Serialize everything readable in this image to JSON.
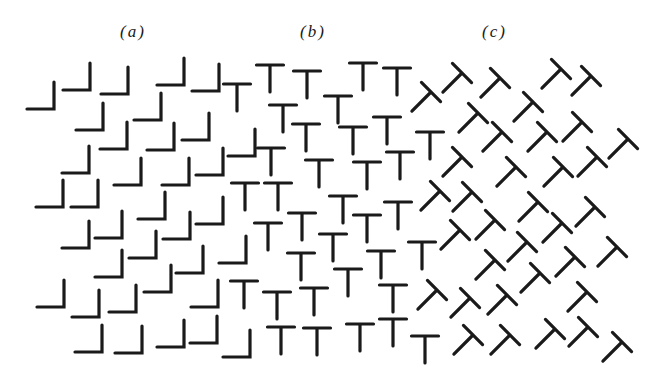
{
  "figure": {
    "labels": [
      {
        "id": "a",
        "text": "(a)",
        "x": 120
      },
      {
        "id": "b",
        "text": "(b)",
        "x": 300
      },
      {
        "id": "c",
        "text": "(c)",
        "x": 482
      }
    ],
    "ink_color": "#1a1a1a",
    "background_color": "#ffffff",
    "glyph_size": 27,
    "regions": {
      "a": {
        "shape": "L",
        "description": "mirrored L shapes (corner at bottom-right)",
        "corners": [
          [
            54,
            109
          ],
          [
            90,
            90
          ],
          [
            128,
            94
          ],
          [
            184,
            85
          ],
          [
            219,
            91
          ],
          [
            103,
            130
          ],
          [
            161,
            120
          ],
          [
            127,
            149
          ],
          [
            174,
            150
          ],
          [
            209,
            140
          ],
          [
            255,
            156
          ],
          [
            89,
            173
          ],
          [
            141,
            185
          ],
          [
            189,
            185
          ],
          [
            223,
            175
          ],
          [
            63,
            207
          ],
          [
            98,
            207
          ],
          [
            165,
            219
          ],
          [
            223,
            224
          ],
          [
            89,
            248
          ],
          [
            122,
            238
          ],
          [
            190,
            239
          ],
          [
            156,
            258
          ],
          [
            246,
            263
          ],
          [
            122,
            277
          ],
          [
            203,
            273
          ],
          [
            64,
            307
          ],
          [
            99,
            317
          ],
          [
            136,
            312
          ],
          [
            171,
            292
          ],
          [
            218,
            307
          ],
          [
            102,
            352
          ],
          [
            142,
            353
          ],
          [
            184,
            347
          ],
          [
            217,
            343
          ],
          [
            250,
            357
          ]
        ]
      },
      "b": {
        "shape": "T",
        "description": "upright T shapes (crossbar top-center)",
        "tops": [
          [
            237,
            84
          ],
          [
            270,
            65
          ],
          [
            307,
            71
          ],
          [
            363,
            63
          ],
          [
            397,
            68
          ],
          [
            283,
            105
          ],
          [
            338,
            96
          ],
          [
            306,
            124
          ],
          [
            353,
            127
          ],
          [
            387,
            117
          ],
          [
            430,
            132
          ],
          [
            271,
            148
          ],
          [
            319,
            160
          ],
          [
            367,
            162
          ],
          [
            400,
            152
          ],
          [
            245,
            183
          ],
          [
            278,
            183
          ],
          [
            343,
            196
          ],
          [
            398,
            202
          ],
          [
            302,
            213
          ],
          [
            367,
            215
          ],
          [
            268,
            223
          ],
          [
            333,
            234
          ],
          [
            422,
            242
          ],
          [
            301,
            253
          ],
          [
            381,
            251
          ],
          [
            348,
            269
          ],
          [
            244,
            281
          ],
          [
            277,
            292
          ],
          [
            314,
            288
          ],
          [
            393,
            285
          ],
          [
            281,
            327
          ],
          [
            317,
            328
          ],
          [
            360,
            324
          ],
          [
            393,
            319
          ],
          [
            425,
            336
          ]
        ]
      },
      "c": {
        "shape": "T-rotated-45",
        "description": "T shapes rotated 45 degrees clockwise (junction point)",
        "rotation_deg": 45,
        "junctions": [
          [
            431,
            92
          ],
          [
            462,
            73
          ],
          [
            500,
            78
          ],
          [
            561,
            69
          ],
          [
            591,
            76
          ],
          [
            478,
            113
          ],
          [
            533,
            102
          ],
          [
            502,
            132
          ],
          [
            547,
            132
          ],
          [
            582,
            122
          ],
          [
            628,
            139
          ],
          [
            462,
            157
          ],
          [
            516,
            167
          ],
          [
            563,
            167
          ],
          [
            597,
            157
          ],
          [
            440,
            191
          ],
          [
            472,
            192
          ],
          [
            538,
            202
          ],
          [
            595,
            207
          ],
          [
            460,
            230
          ],
          [
            495,
            220
          ],
          [
            562,
            223
          ],
          [
            527,
            242
          ],
          [
            617,
            247
          ],
          [
            495,
            260
          ],
          [
            575,
            257
          ],
          [
            540,
            273
          ],
          [
            437,
            290
          ],
          [
            470,
            298
          ],
          [
            507,
            295
          ],
          [
            587,
            292
          ],
          [
            473,
            335
          ],
          [
            510,
            335
          ],
          [
            555,
            329
          ],
          [
            588,
            327
          ],
          [
            622,
            342
          ]
        ]
      }
    }
  }
}
